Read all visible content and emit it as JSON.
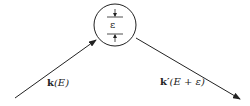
{
  "diagram": {
    "type": "scattering-vertex",
    "vertex": {
      "label": "ε",
      "center": [
        115,
        25
      ],
      "radius": 21
    },
    "incoming": {
      "bold": "k",
      "arg": "(E)",
      "from": [
        15,
        98
      ],
      "to": [
        96,
        40
      ]
    },
    "outgoing": {
      "bold": "k′",
      "arg": "(E + ε)",
      "from": [
        136,
        38
      ],
      "to": [
        240,
        99
      ]
    },
    "colors": {
      "stroke": "#222222",
      "background": "#ffffff"
    }
  }
}
